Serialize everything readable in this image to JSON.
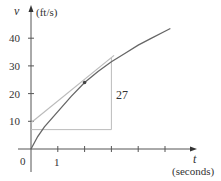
{
  "chart_data": {
    "type": "line",
    "title": "",
    "xlabel": "t (seconds)",
    "ylabel": "v (ft/s)",
    "x_var": "t",
    "x_unit": "(seconds)",
    "y_var": "v",
    "y_unit": "(ft/s)",
    "xlim": [
      0,
      6
    ],
    "ylim": [
      0,
      45
    ],
    "x_ticks": [
      1,
      2,
      3,
      4,
      5
    ],
    "x_tick_labels": [
      "0",
      "1"
    ],
    "y_ticks": [
      10,
      20,
      30,
      40
    ],
    "y_tick_labels": [
      "10",
      "20",
      "30",
      "40"
    ],
    "grid": false,
    "series": [
      {
        "name": "velocity curve",
        "x": [
          0,
          0.25,
          0.5,
          1,
          1.5,
          2,
          2.5,
          3,
          3.5,
          4,
          4.5,
          5,
          5.2
        ],
        "values": [
          0,
          4.5,
          8,
          13.5,
          19,
          24,
          28,
          31.5,
          34.5,
          37.5,
          40,
          42.5,
          43.5
        ]
      },
      {
        "name": "tangent line at t=2",
        "x": [
          0,
          3.1
        ],
        "values": [
          9.5,
          33.8
        ]
      }
    ],
    "highlight_point": {
      "t": 2,
      "v": 24
    },
    "slope_triangle": {
      "run": [
        0,
        3
      ],
      "base_v": 7,
      "rise_label": "27",
      "top_v": 33
    },
    "annotations": [
      "27"
    ]
  }
}
